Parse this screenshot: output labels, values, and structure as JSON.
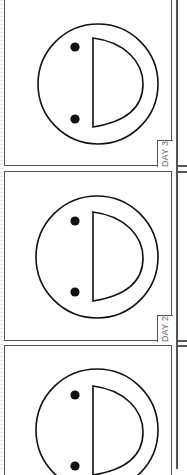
{
  "worksheet": {
    "panels": [
      {
        "day_label": "DAY 3",
        "face": "sideways-smiley"
      },
      {
        "day_label": "DAY 2",
        "face": "sideways-smiley"
      },
      {
        "day_label": "DAY 1",
        "face": "sideways-smiley"
      }
    ],
    "colors": {
      "border": "#555555",
      "ink": "#111111",
      "label": "#666666",
      "background": "#ffffff"
    }
  }
}
